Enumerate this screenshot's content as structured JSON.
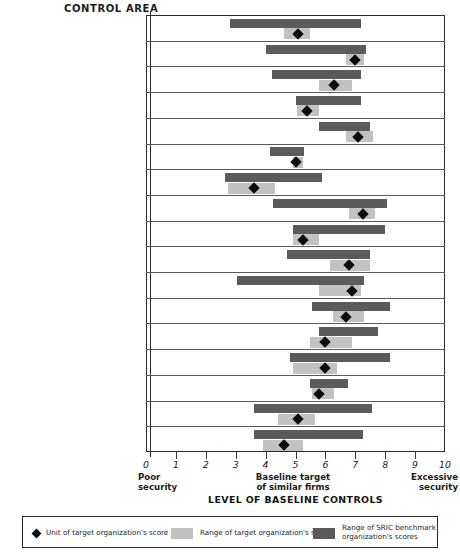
{
  "header": {
    "control_area_label": "CONTROL AREA"
  },
  "axis": {
    "title": "LEVEL OF BASELINE CONTROLS",
    "ticks": [
      "0",
      "1",
      "2",
      "3",
      "4",
      "5",
      "6",
      "7",
      "8",
      "9",
      "10"
    ],
    "note_low": "Poor\nsecurity",
    "note_mid": "Baseline target\nof similar firms",
    "note_high": "Excessive\nsecurity"
  },
  "legend": {
    "unit_label": "Unit of target organization's score",
    "target_range_label": "Range of target organization's scores",
    "sric_range_label": "Range of SRIC benchmark\norganization's scores"
  },
  "colors": {
    "dark_bar": "#5b5b5b",
    "light_bar": "#c2c2c2",
    "marker": "#0b0b0b",
    "frame": "#2b2b2b"
  },
  "chart_data": {
    "type": "bar",
    "title": "CONTROL AREA",
    "xlabel": "LEVEL OF BASELINE CONTROLS",
    "ylabel": "CONTROL AREA",
    "xlim": [
      0,
      10
    ],
    "grid": false,
    "baseline": 5,
    "legend_position": "bottom",
    "series": [
      {
        "name": "Range of SRIC benchmark organization's scores",
        "type": "range-bar",
        "color": "#5b5b5b"
      },
      {
        "name": "Range of target organization's scores",
        "type": "range-bar",
        "color": "#c2c2c2"
      },
      {
        "name": "Unit of target organization's score",
        "type": "marker",
        "color": "#0b0b0b"
      }
    ],
    "categories": [
      "Policies and awareness",
      "Organizational roles\nand responsibilities",
      "Authorizations, agreements,\nand contracts",
      "Information security audits,\nreviews, and risk assessments",
      "Physical security",
      "Network communications\nsecurity",
      "Distributed system security",
      "User identification\nand authentication",
      "Computer and network\nsystems security",
      "Security audit logs\nand monitoring",
      "Protection from\nmalicious software",
      "Backup and recovery",
      "Configuration and\nsoftware management",
      "System development\nand acquisition",
      "Operations",
      "Voice system security",
      "Workstation security"
    ],
    "rows": [
      {
        "label": "Policies and awareness",
        "sric": [
          2.8,
          7.2
        ],
        "target": [
          4.6,
          5.5
        ],
        "score": 5.1
      },
      {
        "label": "Organizational roles\nand responsibilities",
        "sric": [
          4.0,
          7.35
        ],
        "target": [
          6.7,
          7.3
        ],
        "score": 7.0
      },
      {
        "label": "Authorizations, agreements,\nand contracts",
        "sric": [
          4.2,
          7.2
        ],
        "target": [
          5.8,
          6.9
        ],
        "score": 6.3
      },
      {
        "label": "Information security audits,\nreviews, and risk assessments",
        "sric": [
          5.0,
          7.2
        ],
        "target": [
          5.05,
          5.8
        ],
        "score": 5.4
      },
      {
        "label": "Physical security",
        "sric": [
          5.8,
          7.5
        ],
        "target": [
          6.7,
          7.6
        ],
        "score": 7.1
      },
      {
        "label": "Network communications\nsecurity",
        "sric": [
          4.15,
          5.3
        ],
        "target": [
          4.9,
          5.25
        ],
        "score": 5.0
      },
      {
        "label": "Distributed system security",
        "sric": [
          2.65,
          5.9
        ],
        "target": [
          2.75,
          4.3
        ],
        "score": 3.6
      },
      {
        "label": "User identification\nand authentication",
        "sric": [
          4.25,
          8.05
        ],
        "target": [
          6.8,
          7.65
        ],
        "score": 7.25
      },
      {
        "label": "Computer and network\nsystems security",
        "sric": [
          4.9,
          8.0
        ],
        "target": [
          4.9,
          5.8
        ],
        "score": 5.25
      },
      {
        "label": "Security audit logs\nand monitoring",
        "sric": [
          4.7,
          7.5
        ],
        "target": [
          6.15,
          7.5
        ],
        "score": 6.8
      },
      {
        "label": "Protection from\nmalicious software",
        "sric": [
          3.05,
          7.3
        ],
        "target": [
          5.8,
          7.2
        ],
        "score": 6.9
      },
      {
        "label": "Backup and recovery",
        "sric": [
          5.55,
          8.15
        ],
        "target": [
          6.25,
          7.3
        ],
        "score": 6.7
      },
      {
        "label": "Configuration and\nsoftware management",
        "sric": [
          5.8,
          7.75
        ],
        "target": [
          5.5,
          6.9
        ],
        "score": 6.0
      },
      {
        "label": "System development\nand acquisition",
        "sric": [
          4.8,
          8.15
        ],
        "target": [
          4.9,
          6.4
        ],
        "score": 6.0
      },
      {
        "label": "Operations",
        "sric": [
          5.5,
          6.75
        ],
        "target": [
          5.55,
          6.3
        ],
        "score": 5.8
      },
      {
        "label": "Voice system security",
        "sric": [
          3.6,
          7.55
        ],
        "target": [
          4.4,
          5.65
        ],
        "score": 5.1
      },
      {
        "label": "Workstation security",
        "sric": [
          3.6,
          7.25
        ],
        "target": [
          3.9,
          5.25
        ],
        "score": 4.6
      }
    ]
  }
}
